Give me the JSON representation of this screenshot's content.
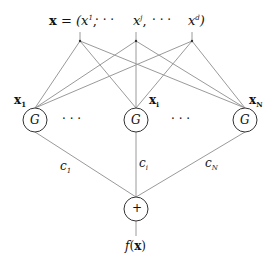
{
  "diagram": {
    "type": "rbf-network",
    "input_vector": {
      "symbol": "x",
      "equals": "=",
      "open": "(",
      "close": ")",
      "components": [
        {
          "base": "x",
          "sup": "1",
          "sep": ","
        },
        {
          "base": "x",
          "sup": "j",
          "sep": ","
        },
        {
          "base": "x",
          "sup": "d",
          "sep": ""
        }
      ],
      "ellipsis": "·   ·   ·"
    },
    "hidden_nodes": [
      {
        "center_label": "x",
        "center_sub": "1",
        "node_label": "G"
      },
      {
        "center_label": "x",
        "center_sub": "i",
        "node_label": "G"
      },
      {
        "center_label": "x",
        "center_sub": "N",
        "node_label": "G"
      }
    ],
    "hidden_ellipsis": "·   ·   ·",
    "weights": [
      {
        "base": "c",
        "sub": "1"
      },
      {
        "base": "c",
        "sub": "i"
      },
      {
        "base": "c",
        "sub": "N"
      }
    ],
    "sum_node": {
      "label": "+"
    },
    "output": {
      "func": "f",
      "arg": "x"
    },
    "colors": {
      "line": "#9a9a9a",
      "stroke": "#333333",
      "text": "#111111"
    }
  }
}
